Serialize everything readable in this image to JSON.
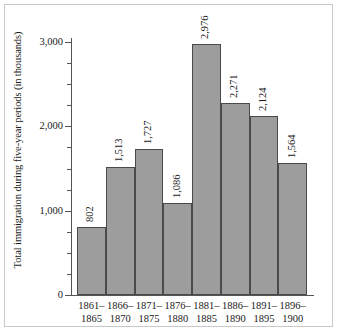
{
  "chart_data": {
    "type": "bar",
    "title": "",
    "subtitle": "",
    "xlabel": "",
    "ylabel": "Total immigration during five-year periods (in thousands)",
    "categories": [
      "1861–\n1865",
      "1866–\n1870",
      "1871–\n1875",
      "1876–\n1880",
      "1881–\n1885",
      "1886–\n1890",
      "1891–\n1895",
      "1896–\n1900"
    ],
    "category_lines": [
      [
        "1861–",
        "1865"
      ],
      [
        "1866–",
        "1870"
      ],
      [
        "1871–",
        "1875"
      ],
      [
        "1876–",
        "1880"
      ],
      [
        "1881–",
        "1885"
      ],
      [
        "1886–",
        "1890"
      ],
      [
        "1891–",
        "1895"
      ],
      [
        "1896–",
        "1900"
      ]
    ],
    "values": [
      802,
      1513,
      1727,
      1086,
      2976,
      2271,
      2124,
      1564
    ],
    "value_labels": [
      "802",
      "1,513",
      "1,727",
      "1,086",
      "2,976",
      "2,271",
      "2,124",
      "1,564"
    ],
    "ylim": [
      0,
      3100
    ],
    "ytick_values": [
      0,
      1000,
      2000,
      3000
    ],
    "ytick_labels": [
      "0",
      "1,000",
      "2,000",
      "3,000"
    ],
    "yminor_tick_values": [
      250,
      500,
      750,
      1250,
      1500,
      1750,
      2250,
      2500,
      2750
    ],
    "grid": false,
    "legend": null,
    "legend_position": "none",
    "bar_fill_color": "#9d9d9d",
    "bar_edge_color": "#4a4a4a",
    "axis_color": "#555555",
    "frame_color": "#c9c9c9",
    "background_color": "#ffffff",
    "value_label_rotation_deg": 90,
    "bars_contiguous": true
  }
}
